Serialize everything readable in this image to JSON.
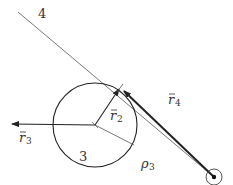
{
  "diagram": {
    "type": "kinematic-vector-loop",
    "labels": {
      "link4": "4",
      "link3": "3",
      "r2": "r",
      "r2_sub": "2",
      "r3": "r",
      "r3_sub": "3",
      "r4": "r",
      "r4_sub": "4",
      "rho3": "ρ",
      "rho3_sub": "3"
    },
    "colors": {
      "line": "#222222",
      "thin_line": "#555555",
      "text": "#333333",
      "background": "#ffffff"
    }
  }
}
